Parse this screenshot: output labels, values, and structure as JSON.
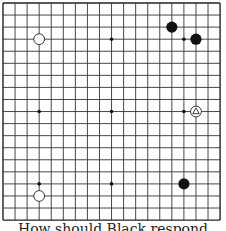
{
  "board": {
    "size": 19,
    "origin": [
      3,
      3
    ],
    "spacing": 12.06,
    "line_color": "#333333",
    "edge_color": "#222222",
    "star_points": [
      [
        3,
        3
      ],
      [
        9,
        3
      ],
      [
        15,
        3
      ],
      [
        3,
        9
      ],
      [
        9,
        9
      ],
      [
        15,
        9
      ],
      [
        3,
        15
      ],
      [
        9,
        15
      ],
      [
        15,
        15
      ]
    ],
    "stones": [
      {
        "color": "white",
        "col": 3,
        "row": 3
      },
      {
        "color": "black",
        "col": 14,
        "row": 2
      },
      {
        "color": "black",
        "col": 16,
        "row": 3
      },
      {
        "color": "white",
        "col": 16,
        "row": 9,
        "marker": "triangle"
      },
      {
        "color": "black",
        "col": 15,
        "row": 15
      },
      {
        "color": "white",
        "col": 3,
        "row": 16
      }
    ]
  },
  "caption": {
    "text": "How should Black respond"
  }
}
